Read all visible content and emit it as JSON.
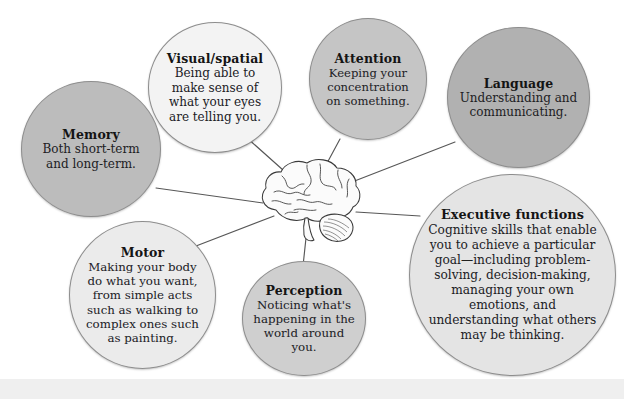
{
  "diagram": {
    "center_icon": "brain-icon",
    "nodes": [
      {
        "id": "memory",
        "title": "Memory",
        "description": "Both short-term and long-term.",
        "fill": "#bcbcbc"
      },
      {
        "id": "visual-spatial",
        "title": "Visual/spatial",
        "description": "Being able to make sense of what your eyes are telling you.",
        "fill": "#f3f3f3"
      },
      {
        "id": "attention",
        "title": "Attention",
        "description": "Keeping your concentration on something.",
        "fill": "#c5c5c5"
      },
      {
        "id": "language",
        "title": "Language",
        "description": "Understanding and communicating.",
        "fill": "#b1b1b1"
      },
      {
        "id": "motor",
        "title": "Motor",
        "description": "Making your body do what you want, from simple acts such as walking to complex ones such as painting.",
        "fill": "#ebebeb"
      },
      {
        "id": "perception",
        "title": "Perception",
        "description": "Noticing what's happening in the world around you.",
        "fill": "#cfcfcf"
      },
      {
        "id": "executive-functions",
        "title": "Executive functions",
        "description": "Cognitive skills that enable you to achieve a particular goal—including problem-solving, decision-making, managing your own emotions, and understanding what others may be thinking.",
        "fill": "#e4e4e4"
      }
    ],
    "colors": {
      "background": "#ffffff",
      "connector": "#575757",
      "node_outline": "#8d8d8d",
      "text": "#20201f",
      "footer_band": "#efefef"
    }
  }
}
